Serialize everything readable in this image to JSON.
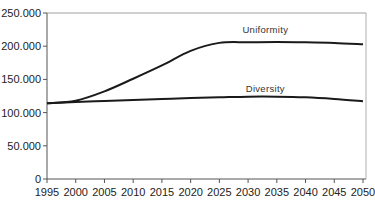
{
  "chart_data": {
    "type": "line",
    "title": "",
    "xlabel": "",
    "ylabel": "",
    "x": [
      1995,
      2000,
      2005,
      2010,
      2015,
      2020,
      2025,
      2030,
      2035,
      2040,
      2045,
      2050
    ],
    "xticks": [
      "1995",
      "2000",
      "2005",
      "2010",
      "2015",
      "2020",
      "2025",
      "2030",
      "2035",
      "2040",
      "2045",
      "2050"
    ],
    "yticks": [
      "0",
      "50.000",
      "100.000",
      "150.000",
      "200.000",
      "250.000"
    ],
    "ytick_values": [
      0,
      50000,
      100000,
      150000,
      200000,
      250000
    ],
    "ylim": [
      0,
      250000
    ],
    "xlim": [
      1995,
      2050
    ],
    "grid": false,
    "legend": "inline labels",
    "series": [
      {
        "name": "Uniformity",
        "label_pos": {
          "year": 2033,
          "value": 220000
        },
        "values": [
          114000,
          118000,
          132000,
          151000,
          171000,
          193000,
          205000,
          206000,
          206500,
          206000,
          205000,
          203000
        ]
      },
      {
        "name": "Diversity",
        "label_pos": {
          "year": 2033,
          "value": 131000
        },
        "values": [
          114000,
          116000,
          117500,
          119000,
          120500,
          122000,
          123000,
          124000,
          124000,
          123000,
          120500,
          117000
        ]
      }
    ]
  }
}
